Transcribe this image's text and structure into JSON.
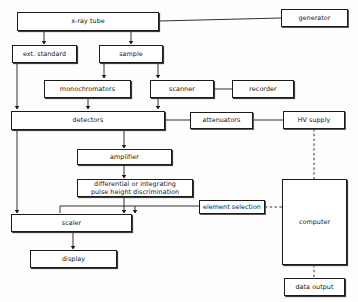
{
  "diagram": {
    "background_color": "#fdfdfd",
    "line_color": "#1a1a1a",
    "nodes": [
      {
        "id": "xray_tube",
        "label": "x-ray tube"
      },
      {
        "id": "generator",
        "label": "generator"
      },
      {
        "id": "ext_standard",
        "label": "ext. standard"
      },
      {
        "id": "sample",
        "label": "sample"
      },
      {
        "id": "monochromators",
        "label": "monochromators"
      },
      {
        "id": "scanner",
        "label": "scanner"
      },
      {
        "id": "recorder",
        "label": "recorder"
      },
      {
        "id": "detectors",
        "label": "detectors"
      },
      {
        "id": "attenuators",
        "label": "attenuators"
      },
      {
        "id": "hv_supply",
        "label": "HV supply"
      },
      {
        "id": "amplifier",
        "label": "amplifier"
      },
      {
        "id": "discrimination",
        "label": "differential or integrating\npulse height discrimination"
      },
      {
        "id": "element_selection",
        "label": "element selection"
      },
      {
        "id": "computer",
        "label": "computer"
      },
      {
        "id": "scaler",
        "label": "scaler"
      },
      {
        "id": "display",
        "label": "display"
      },
      {
        "id": "data_output",
        "label": "data output"
      }
    ],
    "connections": [
      {
        "from": "xray_tube",
        "to": "generator",
        "style": "solid",
        "arrow": false
      },
      {
        "from": "xray_tube",
        "to": "ext_standard",
        "style": "solid",
        "arrow": true
      },
      {
        "from": "xray_tube",
        "to": "sample",
        "style": "solid",
        "arrow": true
      },
      {
        "from": "sample",
        "to": "monochromators",
        "style": "solid",
        "arrow": true
      },
      {
        "from": "sample",
        "to": "scanner",
        "style": "solid",
        "arrow": true
      },
      {
        "from": "scanner",
        "to": "recorder",
        "style": "solid",
        "arrow": false
      },
      {
        "from": "ext_standard",
        "to": "detectors",
        "style": "solid",
        "arrow": true
      },
      {
        "from": "monochromators",
        "to": "detectors",
        "style": "solid",
        "arrow": true
      },
      {
        "from": "scanner",
        "to": "detectors",
        "style": "solid",
        "arrow": true
      },
      {
        "from": "detectors",
        "to": "attenuators",
        "style": "solid",
        "arrow": false
      },
      {
        "from": "attenuators",
        "to": "hv_supply",
        "style": "solid",
        "arrow": false
      },
      {
        "from": "hv_supply",
        "to": "computer",
        "style": "dashed",
        "arrow": false
      },
      {
        "from": "detectors",
        "to": "amplifier",
        "style": "solid",
        "arrow": true
      },
      {
        "from": "amplifier",
        "to": "discrimination",
        "style": "solid",
        "arrow": true
      },
      {
        "from": "discrimination",
        "to": "scaler",
        "style": "solid",
        "arrow": true
      },
      {
        "from": "discrimination",
        "to": "element_selection",
        "style": "solid",
        "arrow": false
      },
      {
        "from": "element_selection",
        "to": "computer",
        "style": "dashed",
        "arrow": false
      },
      {
        "from": "ext_standard",
        "to": "scaler",
        "style": "solid",
        "arrow": true
      },
      {
        "from": "scaler",
        "to": "display",
        "style": "solid",
        "arrow": true
      },
      {
        "from": "computer",
        "to": "data_output",
        "style": "dashed",
        "arrow": false
      }
    ]
  }
}
